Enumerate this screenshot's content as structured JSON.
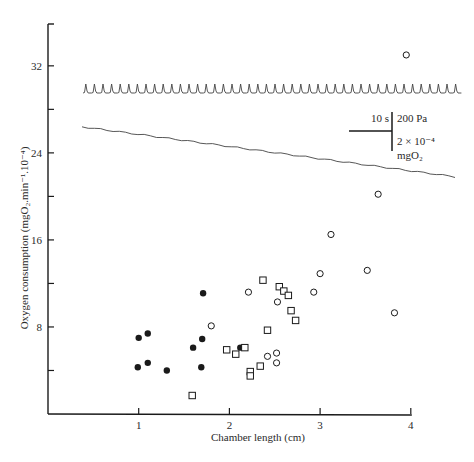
{
  "chart_data": {
    "type": "scatter",
    "title": "",
    "xlabel": "Chamber length (cm)",
    "ylabel": "Oxygen consumption (mgO₂.min⁻¹.10⁻⁴)",
    "xlim": [
      0,
      4
    ],
    "ylim": [
      0,
      36
    ],
    "x_ticks": [
      1,
      2,
      3,
      4
    ],
    "x_tick_labels": [
      "1",
      "2",
      "3",
      "4"
    ],
    "y_ticks": [
      4,
      8,
      12,
      16,
      20,
      24,
      28,
      32
    ],
    "y_tick_labels": [
      "",
      "8",
      "",
      "16",
      "",
      "24",
      "",
      "32"
    ],
    "grid": false,
    "legend": null,
    "series": [
      {
        "name": "filled circles",
        "marker": "filled-circle",
        "points": [
          [
            1.0,
            7.0
          ],
          [
            1.1,
            7.4
          ],
          [
            0.99,
            4.3
          ],
          [
            1.1,
            4.7
          ],
          [
            1.31,
            4.0
          ],
          [
            1.6,
            6.1
          ],
          [
            1.7,
            6.9
          ],
          [
            1.69,
            4.3
          ],
          [
            1.71,
            11.1
          ],
          [
            2.12,
            6.1
          ]
        ]
      },
      {
        "name": "open circles",
        "marker": "open-circle",
        "points": [
          [
            1.8,
            8.1
          ],
          [
            2.21,
            11.2
          ],
          [
            2.53,
            10.3
          ],
          [
            2.93,
            11.2
          ],
          [
            2.42,
            5.3
          ],
          [
            2.52,
            5.6
          ],
          [
            2.52,
            4.7
          ],
          [
            3.0,
            12.9
          ],
          [
            3.12,
            16.5
          ],
          [
            3.52,
            13.2
          ],
          [
            3.64,
            20.2
          ],
          [
            3.82,
            9.3
          ],
          [
            3.95,
            33.0
          ]
        ]
      },
      {
        "name": "open squares",
        "marker": "open-square",
        "points": [
          [
            1.59,
            1.7
          ],
          [
            1.97,
            5.9
          ],
          [
            2.07,
            5.5
          ],
          [
            2.17,
            6.1
          ],
          [
            2.23,
            3.9
          ],
          [
            2.23,
            3.5
          ],
          [
            2.34,
            4.4
          ],
          [
            2.42,
            7.7
          ],
          [
            2.37,
            12.3
          ],
          [
            2.55,
            11.7
          ],
          [
            2.6,
            11.3
          ],
          [
            2.65,
            10.9
          ],
          [
            2.68,
            9.5
          ],
          [
            2.73,
            8.6
          ]
        ]
      }
    ],
    "inset_traces": [
      {
        "name": "pressure trace",
        "description": "periodic spiky pressure recording",
        "y_level_approx": 29.6
      },
      {
        "name": "oxygen trace",
        "description": "slowly declining oxygen recording",
        "start_approx": 26.4,
        "end_approx": 21.8
      }
    ],
    "scale_bar": {
      "time_label": "10 s",
      "pressure_label": "200 Pa",
      "oxygen_label_line1": "2 × 10⁻⁴",
      "oxygen_label_line2": "mgO₂"
    }
  },
  "axes": {
    "xlabel": "Chamber length (cm)",
    "ylabel": "Oxygen consumption (mgO₂.min⁻¹.10⁻⁴)"
  },
  "colors": {
    "ink": "#1a1a1a",
    "trace": "#444444",
    "background": "#ffffff"
  }
}
